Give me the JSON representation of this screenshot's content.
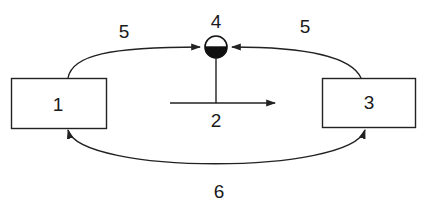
{
  "diagram": {
    "nodes": [
      {
        "id": "box-1",
        "label": "1",
        "shape": "rectangle"
      },
      {
        "id": "box-3",
        "label": "3",
        "shape": "rectangle"
      },
      {
        "id": "node-4",
        "label": "4",
        "shape": "half-filled-circle"
      }
    ],
    "edges": [
      {
        "id": "edge-5-left",
        "from": "box-1",
        "to": "node-4",
        "label": "5",
        "direction": "forward"
      },
      {
        "id": "edge-5-right",
        "from": "box-3",
        "to": "node-4",
        "label": "5",
        "direction": "forward"
      },
      {
        "id": "edge-2",
        "from": "node-4",
        "to": "right",
        "label": "2",
        "direction": "forward",
        "style": "stem-and-horizontal-arrow"
      },
      {
        "id": "edge-6",
        "from": "box-1",
        "to": "box-3",
        "label": "6",
        "direction": "bidirectional"
      }
    ],
    "labels": {
      "box1": "1",
      "box3": "3",
      "node4": "4",
      "arrow5_left": "5",
      "arrow5_right": "5",
      "arrow2": "2",
      "arrow6": "6"
    },
    "colors": {
      "stroke": "#222222",
      "fill_dark": "#111111",
      "background": "#ffffff"
    }
  }
}
